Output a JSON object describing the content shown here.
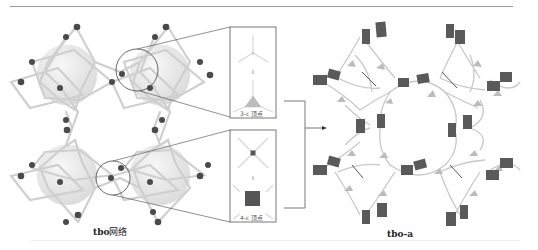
{
  "figure": {
    "left_panel": {
      "caption_bold": "tbo",
      "caption_rest": "网络",
      "description": "tbo net with spheres in cages"
    },
    "insets": [
      {
        "label": "3-c 顶点",
        "arrow_symbol": "⇓",
        "vertex_type": "triangle"
      },
      {
        "label": "4-c 顶点",
        "arrow_symbol": "⇓",
        "vertex_type": "square"
      }
    ],
    "right_panel": {
      "caption": "tbo-a"
    },
    "colors": {
      "node": "#4a4a4a",
      "rod": "#d6d6d6",
      "sphere": "#ececec",
      "square": "#555555",
      "triangle": "#bdbdbd",
      "frame": "#555555"
    }
  }
}
